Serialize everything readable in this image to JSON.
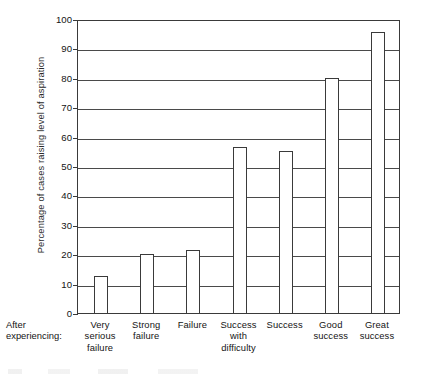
{
  "chart_data": {
    "type": "bar",
    "title": "",
    "xlabel": "After experiencing:",
    "ylabel": "Percentage of cases raising level of aspiration",
    "categories": [
      "Very serious failure",
      "Strong failure",
      "Failure",
      "Success with difficulty",
      "Success",
      "Good success",
      "Great success"
    ],
    "values": [
      12.5,
      20,
      21.5,
      56.5,
      55,
      80,
      95.5
    ],
    "ylim": [
      0,
      100
    ],
    "yticks": [
      0,
      10,
      20,
      30,
      40,
      50,
      60,
      70,
      80,
      90,
      100
    ],
    "ytick_labels": [
      "0",
      "10",
      "20",
      "30",
      "40",
      "50",
      "60",
      "70",
      "80",
      "90",
      "100"
    ],
    "grid": true,
    "legend": "none"
  },
  "axis": {
    "y_title": "Percentage of cases raising level of aspiration",
    "x_prefix_line1": "After",
    "x_prefix_line2": "experiencing:"
  },
  "categories_wrapped": [
    [
      "Very",
      "serious",
      "failure"
    ],
    [
      "Strong",
      "failure"
    ],
    [
      "Failure"
    ],
    [
      "Success",
      "with",
      "difficulty"
    ],
    [
      "Success"
    ],
    [
      "Good",
      "success"
    ],
    [
      "Great",
      "success"
    ]
  ],
  "colors": {
    "bar_fill": "#ffffff",
    "bar_stroke": "#3a3a3a",
    "grid": "#4a4a4a",
    "frame": "#3a3a3a",
    "text": "#141414",
    "background": "#ffffff"
  }
}
